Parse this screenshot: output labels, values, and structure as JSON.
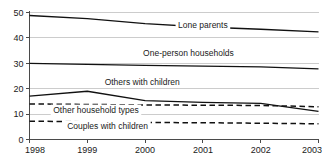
{
  "chart_data": {
    "type": "line",
    "title": "",
    "subtitle": "",
    "xlabel": "",
    "ylabel": "",
    "x": [
      1998,
      1999,
      2000,
      2001,
      2002,
      2003
    ],
    "categories": [
      "1998",
      "1999",
      "2000",
      "2001",
      "2002",
      "2003"
    ],
    "xlim": [
      1998,
      2003
    ],
    "ylim": [
      0,
      50
    ],
    "yticks": [
      0,
      10,
      20,
      30,
      40,
      50
    ],
    "ytick_labels": [
      "0",
      "10",
      "20",
      "30",
      "40",
      "50"
    ],
    "xticks": [
      1998,
      1999,
      2000,
      2001,
      2002,
      2003
    ],
    "xtick_labels": [
      "1998",
      "1999",
      "2000",
      "2001",
      "2002",
      "2003"
    ],
    "grid": true,
    "grid_axis": "y",
    "legend": "inline-labels",
    "legend_position": "inline",
    "series": [
      {
        "name": "Lone parents",
        "style": "solid",
        "color": "#111111",
        "values": [
          48.8,
          47.6,
          45.6,
          44.3,
          43.4,
          42.4
        ],
        "label_x": 2001.0,
        "label_y": 44.0
      },
      {
        "name": "One-person households",
        "style": "solid",
        "color": "#111111",
        "values": [
          30.0,
          29.6,
          29.2,
          28.9,
          28.6,
          27.8
        ],
        "label_x": 2000.75,
        "label_y": 33.0
      },
      {
        "name": "Others with children",
        "style": "solid",
        "color": "#111111",
        "values": [
          17.1,
          19.0,
          15.3,
          14.6,
          14.2,
          11.1
        ],
        "label_x": 1999.95,
        "label_y": 21.5
      },
      {
        "name": "Other household types",
        "style": "dashed",
        "color": "#111111",
        "values": [
          14.0,
          13.8,
          13.6,
          13.5,
          13.4,
          12.9
        ],
        "label_x": 1999.15,
        "label_y": 10.4
      },
      {
        "name": "Couples with children",
        "style": "dashed",
        "color": "#111111",
        "values": [
          7.2,
          7.0,
          6.7,
          6.6,
          6.4,
          6.2
        ],
        "label_x": 1999.35,
        "label_y": 4.2
      }
    ]
  }
}
